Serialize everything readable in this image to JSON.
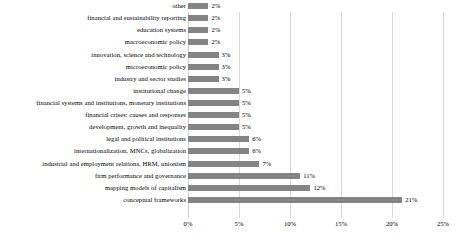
{
  "chart_data": {
    "type": "bar",
    "orientation": "horizontal",
    "title": "",
    "subtitle": "",
    "xlabel": "",
    "ylabel": "",
    "xlim": [
      0,
      25
    ],
    "grid": true,
    "legend": false,
    "bar_color": "#848484",
    "gridline_color": "#d9d9d9",
    "xticks": [
      0,
      5,
      10,
      15,
      20,
      25
    ],
    "xtick_labels": [
      "0%",
      "5%",
      "10%",
      "15%",
      "20%",
      "25%"
    ],
    "categories": [
      "other",
      "financial and sustainability reporting",
      "education systems",
      "macroeconomic policy",
      "innovation, science and technology",
      "microeconomic policy",
      "industry and sector studies",
      "institutional change",
      "financial systems and institutions, monetary institutions",
      "financial crises: causes and responses",
      "development, growth and inequality",
      "legal and political institutions",
      "internationalization, MNCs, globalization",
      "industrial and employment relations, HRM, unionism",
      "firm performance and governance",
      "mapping models of capitalism",
      "conceptual frameworks"
    ],
    "values": [
      2,
      2,
      2,
      2,
      3,
      3,
      3,
      5,
      5,
      5,
      5,
      6,
      6,
      7,
      11,
      12,
      21
    ],
    "value_labels": [
      "2%",
      "2%",
      "2%",
      "2%",
      "3%",
      "3%",
      "3%",
      "5%",
      "5%",
      "5%",
      "5%",
      "6%",
      "6%",
      "7%",
      "11%",
      "12%",
      "21%"
    ]
  }
}
